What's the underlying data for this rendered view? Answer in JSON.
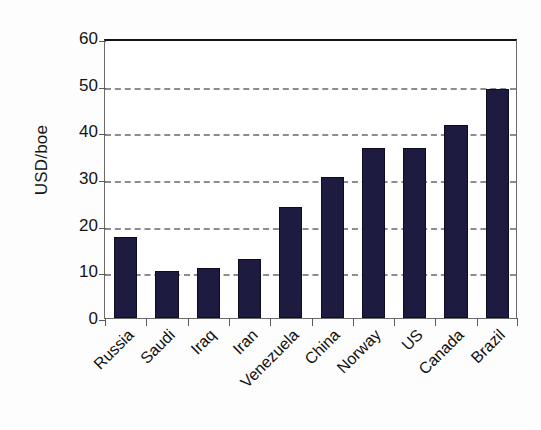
{
  "chart_data": {
    "type": "bar",
    "title": "",
    "xlabel": "",
    "ylabel": "USD/boe",
    "ylim": [
      0,
      60
    ],
    "ytick_labels": [
      "60",
      "50",
      "40",
      "30",
      "20",
      "10",
      "0"
    ],
    "yticks": [
      60,
      50,
      40,
      30,
      20,
      10,
      0
    ],
    "gridlines": [
      50,
      40,
      30,
      20,
      10
    ],
    "grid": true,
    "legend": "none",
    "bar_color": "#1d1b40",
    "categories": [
      "Russia",
      "Saudi",
      "Iraq",
      "Iran",
      "Venezuela",
      "China",
      "Norway",
      "US",
      "Canada",
      "Brazil"
    ],
    "values": [
      17.3,
      10.0,
      10.8,
      12.7,
      23.8,
      30.2,
      36.4,
      36.4,
      41.3,
      49.1
    ]
  },
  "axis": {
    "y_title": "USD/boe"
  },
  "colors": {
    "bar": "#1d1b40",
    "grid": "#8d8d8d",
    "axis": "#5a5a5a",
    "text": "#141414",
    "background": "#ffffff"
  }
}
